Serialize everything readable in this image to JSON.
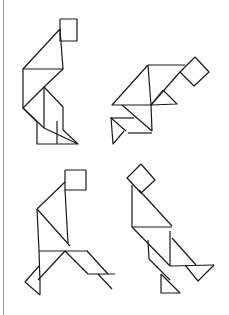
{
  "page": {
    "title": "Tangram figures",
    "background": "#ffffff",
    "line_color": "#1a1a1a",
    "margin_rule_color": "#9a9a9a"
  },
  "figures": [
    {
      "name": "figure-top-left",
      "label": "Tangram figure 1",
      "segments": [
        [
          [
            60,
            19
          ],
          [
            77,
            19
          ],
          [
            77,
            41
          ],
          [
            60,
            41
          ],
          [
            60,
            19
          ]
        ],
        [
          [
            60,
            29
          ],
          [
            23,
            69
          ],
          [
            63,
            69
          ],
          [
            60,
            29
          ]
        ],
        [
          [
            23,
            69
          ],
          [
            23,
            108
          ]
        ],
        [
          [
            63,
            69
          ],
          [
            44,
            87
          ]
        ],
        [
          [
            44,
            87
          ],
          [
            23,
            108
          ],
          [
            44,
            128
          ]
        ],
        [
          [
            44,
            87
          ],
          [
            44,
            128
          ]
        ],
        [
          [
            44,
            87
          ],
          [
            63,
            107
          ],
          [
            63,
            130
          ]
        ],
        [
          [
            23,
            108
          ],
          [
            37,
            122
          ],
          [
            37,
            144
          ],
          [
            78,
            144
          ],
          [
            44,
            128
          ]
        ],
        [
          [
            57,
            121
          ],
          [
            57,
            144
          ]
        ],
        [
          [
            63,
            130
          ],
          [
            78,
            144
          ]
        ]
      ]
    },
    {
      "name": "figure-top-right",
      "label": "Tangram figure 2",
      "segments": [
        [
          [
            195,
            57
          ],
          [
            209,
            72
          ],
          [
            194,
            86
          ],
          [
            180,
            72
          ],
          [
            195,
            57
          ]
        ],
        [
          [
            148,
            65
          ],
          [
            185,
            65
          ]
        ],
        [
          [
            148,
            65
          ],
          [
            112,
            105
          ],
          [
            151,
            105
          ],
          [
            148,
            65
          ]
        ],
        [
          [
            180,
            72
          ],
          [
            151,
            105
          ]
        ],
        [
          [
            163,
            90
          ],
          [
            151,
            105
          ],
          [
            177,
            104
          ],
          [
            163,
            90
          ]
        ],
        [
          [
            122,
            105
          ],
          [
            152,
            131
          ]
        ],
        [
          [
            151,
            105
          ],
          [
            152,
            131
          ]
        ],
        [
          [
            111,
            118
          ],
          [
            134,
            118
          ]
        ],
        [
          [
            128,
            133
          ],
          [
            152,
            133
          ]
        ],
        [
          [
            111,
            117
          ],
          [
            113,
            144
          ],
          [
            124,
            131
          ]
        ],
        [
          [
            111,
            118
          ],
          [
            126,
            131
          ]
        ]
      ]
    },
    {
      "name": "figure-bottom-left",
      "label": "Tangram figure 3",
      "segments": [
        [
          [
            65,
            170
          ],
          [
            86,
            170
          ],
          [
            86,
            190
          ],
          [
            65,
            190
          ],
          [
            65,
            170
          ]
        ],
        [
          [
            65,
            182
          ],
          [
            37,
            209
          ]
        ],
        [
          [
            65,
            190
          ],
          [
            68,
            243
          ]
        ],
        [
          [
            37,
            209
          ],
          [
            70,
            246
          ]
        ],
        [
          [
            37,
            209
          ],
          [
            39,
            251
          ]
        ],
        [
          [
            39,
            251
          ],
          [
            88,
            251
          ]
        ],
        [
          [
            65,
            251
          ],
          [
            38,
            280
          ]
        ],
        [
          [
            65,
            251
          ],
          [
            88,
            274
          ],
          [
            115,
            274
          ]
        ],
        [
          [
            87,
            251
          ],
          [
            108,
            274
          ]
        ],
        [
          [
            98,
            274
          ],
          [
            112,
            289
          ]
        ],
        [
          [
            39,
            251
          ],
          [
            40,
            282
          ],
          [
            40,
            295
          ]
        ],
        [
          [
            39,
            266
          ],
          [
            25,
            282
          ],
          [
            40,
            295
          ]
        ]
      ]
    },
    {
      "name": "figure-bottom-right",
      "label": "Tangram figure 4",
      "segments": [
        [
          [
            141,
            164
          ],
          [
            155,
            180
          ],
          [
            141,
            193
          ],
          [
            127,
            178
          ],
          [
            141,
            164
          ]
        ],
        [
          [
            132,
            185
          ],
          [
            132,
            227
          ]
        ],
        [
          [
            139,
            190
          ],
          [
            172,
            226
          ]
        ],
        [
          [
            132,
            227
          ],
          [
            172,
            227
          ]
        ],
        [
          [
            132,
            227
          ],
          [
            170,
            266
          ]
        ],
        [
          [
            170,
            231
          ],
          [
            170,
            266
          ]
        ],
        [
          [
            148,
            240
          ],
          [
            149,
            259
          ],
          [
            170,
            280
          ]
        ],
        [
          [
            161,
            274
          ],
          [
            161,
            293
          ],
          [
            180,
            293
          ],
          [
            161,
            274
          ]
        ],
        [
          [
            172,
            238
          ],
          [
            196,
            265
          ]
        ],
        [
          [
            170,
            266
          ],
          [
            214,
            265
          ]
        ],
        [
          [
            185,
            265
          ],
          [
            198,
            281
          ],
          [
            214,
            265
          ]
        ]
      ]
    }
  ]
}
